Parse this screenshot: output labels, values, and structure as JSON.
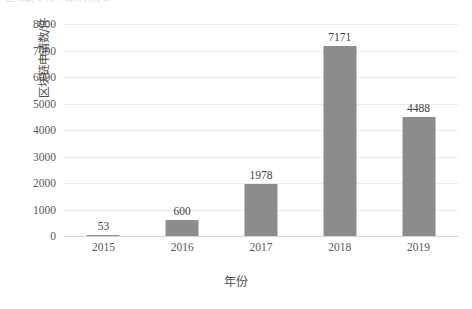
{
  "header": {
    "cropped_fragment": "区块链专利申请态势分析"
  },
  "chart_data": {
    "type": "bar",
    "title": "",
    "categories": [
      "2015",
      "2016",
      "2017",
      "2018",
      "2019"
    ],
    "values": [
      53,
      600,
      1978,
      7171,
      4488
    ],
    "data_labels": [
      "53",
      "600",
      "1978",
      "7171",
      "4488"
    ],
    "xlabel": "年份",
    "ylabel": "区块链申请数/件",
    "ylim": [
      0,
      8000
    ],
    "y_ticks": [
      "0",
      "1000",
      "2000",
      "3000",
      "4000",
      "5000",
      "6000",
      "7000",
      "8000"
    ],
    "y_tick_values": [
      0,
      1000,
      2000,
      3000,
      4000,
      5000,
      6000,
      7000,
      8000
    ],
    "grid": true,
    "legend": "none",
    "bar_color": "#8c8c8c",
    "gridline_color": "#ececec",
    "axis_color": "#d4d4d4",
    "text_color": "#585858"
  }
}
